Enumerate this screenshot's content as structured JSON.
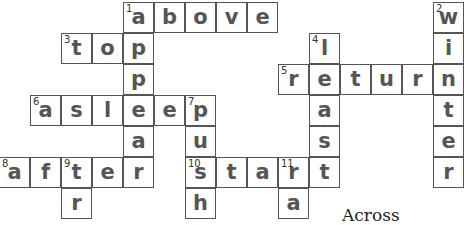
{
  "puzzle": {
    "cell_size": 31,
    "origin_x": -1,
    "origin_y": 2,
    "cells": [
      {
        "col": 4,
        "row": 0,
        "letter": "a",
        "num": "1"
      },
      {
        "col": 5,
        "row": 0,
        "letter": "b"
      },
      {
        "col": 6,
        "row": 0,
        "letter": "o"
      },
      {
        "col": 7,
        "row": 0,
        "letter": "v"
      },
      {
        "col": 8,
        "row": 0,
        "letter": "e"
      },
      {
        "col": 14,
        "row": 0,
        "letter": "w",
        "num": "2"
      },
      {
        "col": 2,
        "row": 1,
        "letter": "t",
        "num": "3"
      },
      {
        "col": 3,
        "row": 1,
        "letter": "o"
      },
      {
        "col": 4,
        "row": 1,
        "letter": "p"
      },
      {
        "col": 10,
        "row": 1,
        "letter": "l",
        "num": "4"
      },
      {
        "col": 14,
        "row": 1,
        "letter": "i"
      },
      {
        "col": 4,
        "row": 2,
        "letter": "p"
      },
      {
        "col": 9,
        "row": 2,
        "letter": "r",
        "num": "5"
      },
      {
        "col": 10,
        "row": 2,
        "letter": "e"
      },
      {
        "col": 11,
        "row": 2,
        "letter": "t"
      },
      {
        "col": 12,
        "row": 2,
        "letter": "u"
      },
      {
        "col": 13,
        "row": 2,
        "letter": "r"
      },
      {
        "col": 14,
        "row": 2,
        "letter": "n"
      },
      {
        "col": 1,
        "row": 3,
        "letter": "a",
        "num": "6"
      },
      {
        "col": 2,
        "row": 3,
        "letter": "s"
      },
      {
        "col": 3,
        "row": 3,
        "letter": "l"
      },
      {
        "col": 4,
        "row": 3,
        "letter": "e"
      },
      {
        "col": 5,
        "row": 3,
        "letter": "e"
      },
      {
        "col": 6,
        "row": 3,
        "letter": "p",
        "num": "7"
      },
      {
        "col": 10,
        "row": 3,
        "letter": "a"
      },
      {
        "col": 14,
        "row": 3,
        "letter": "t"
      },
      {
        "col": 4,
        "row": 4,
        "letter": "a"
      },
      {
        "col": 6,
        "row": 4,
        "letter": "u"
      },
      {
        "col": 10,
        "row": 4,
        "letter": "s"
      },
      {
        "col": 14,
        "row": 4,
        "letter": "e"
      },
      {
        "col": 0,
        "row": 5,
        "letter": "a",
        "num": "8"
      },
      {
        "col": 1,
        "row": 5,
        "letter": "f"
      },
      {
        "col": 2,
        "row": 5,
        "letter": "t",
        "num": "9"
      },
      {
        "col": 3,
        "row": 5,
        "letter": "e"
      },
      {
        "col": 4,
        "row": 5,
        "letter": "r"
      },
      {
        "col": 6,
        "row": 5,
        "letter": "s",
        "num": "10"
      },
      {
        "col": 7,
        "row": 5,
        "letter": "t"
      },
      {
        "col": 8,
        "row": 5,
        "letter": "a"
      },
      {
        "col": 9,
        "row": 5,
        "letter": "r",
        "num": "11"
      },
      {
        "col": 10,
        "row": 5,
        "letter": "t"
      },
      {
        "col": 14,
        "row": 5,
        "letter": "r"
      },
      {
        "col": 2,
        "row": 6,
        "letter": "r"
      },
      {
        "col": 6,
        "row": 6,
        "letter": "h"
      },
      {
        "col": 9,
        "row": 6,
        "letter": "a"
      }
    ]
  },
  "clues": {
    "across_heading": "Across"
  }
}
